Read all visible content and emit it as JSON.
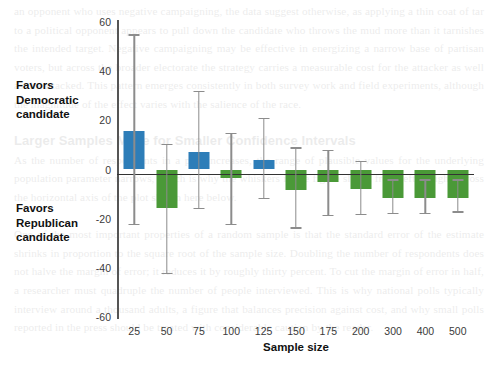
{
  "chart_data": {
    "type": "bar",
    "title": "",
    "xlabel": "Sample size",
    "ylabel": "",
    "categories": [
      "25",
      "50",
      "75",
      "100",
      "125",
      "150",
      "175",
      "200",
      "300",
      "400",
      "500"
    ],
    "values": [
      15.5,
      -15.5,
      7.3,
      -3.3,
      4.0,
      -8.5,
      -5.0,
      -8.0,
      -11.5,
      -11.5,
      -11.5
    ],
    "error_high": [
      55.0,
      10.5,
      32.0,
      15.0,
      21.0,
      9.0,
      8.0,
      3.5,
      -4.0,
      -4.0,
      -4.0
    ],
    "error_low": [
      -22.0,
      -42.0,
      -15.5,
      -22.0,
      -11.5,
      -23.5,
      -18.5,
      -18.0,
      -17.5,
      -17.5,
      -17.0
    ],
    "ylim": [
      -60,
      60
    ],
    "yticks": [
      60,
      40,
      20,
      0,
      -20,
      -40,
      -60
    ],
    "ytick_labels": [
      "60",
      "40",
      "20",
      "0",
      "-20",
      "-40",
      "-60"
    ],
    "grid": false,
    "legend": "none",
    "colors": {
      "positive": "#2d7db8",
      "negative": "#4a9937",
      "error_bar": "#8c8c8c",
      "axis": "#333333"
    },
    "annotations": [
      {
        "id": "favors-democratic",
        "text": "Favors\nDemocratic\ncandidate",
        "side": "left-top"
      },
      {
        "id": "favors-republican",
        "text": "Favors\nRepublican\ncandidate",
        "side": "left-bottom"
      }
    ]
  },
  "annotations": {
    "favors_democratic_line1": "Favors",
    "favors_democratic_line2": "Democratic",
    "favors_democratic_line3": "candidate",
    "favors_republican_line1": "Favors",
    "favors_republican_line2": "Republican",
    "favors_republican_line3": "candidate"
  },
  "axis": {
    "x_title": "Sample size"
  }
}
